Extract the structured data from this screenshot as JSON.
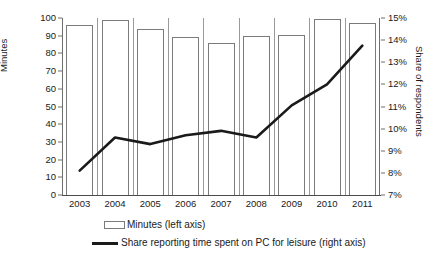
{
  "chart_data": {
    "type": "bar",
    "title": "",
    "xlabel": "",
    "ylabel": "Minutes",
    "y2label": "Share of respondents",
    "categories": [
      "2003",
      "2004",
      "2005",
      "2006",
      "2007",
      "2008",
      "2009",
      "2010",
      "2011"
    ],
    "ylim": [
      0,
      100
    ],
    "yticks": [
      "0",
      "10",
      "20",
      "30",
      "40",
      "50",
      "60",
      "70",
      "80",
      "90",
      "100"
    ],
    "y2lim": [
      7,
      15
    ],
    "y2ticks": [
      "7%",
      "8%",
      "9%",
      "10%",
      "11%",
      "12%",
      "13%",
      "14%",
      "15%"
    ],
    "grid": false,
    "legend_position": "bottom",
    "series": [
      {
        "name": "Minutes (left axis)",
        "type": "bar",
        "axis": "left",
        "unit": "minutes",
        "values": [
          96,
          99,
          94,
          89,
          86,
          90,
          90.5,
          99.5,
          97
        ]
      },
      {
        "name": "Share reporting time spent on PC for leisure (right axis)",
        "type": "line",
        "axis": "right",
        "unit": "percent",
        "values": [
          8.1,
          9.6,
          9.3,
          9.7,
          9.9,
          9.6,
          11.05,
          12.0,
          13.75
        ]
      }
    ]
  },
  "legend": {
    "bar_label": "Minutes (left axis)",
    "line_label": "Share reporting time spent on PC for leisure (right axis)"
  },
  "colors": {
    "bar_outline": "#7b7b7b",
    "line": "#1a1a1a",
    "axis": "#6e6e6e",
    "text": "#1a1a1a",
    "background": "#ffffff"
  }
}
